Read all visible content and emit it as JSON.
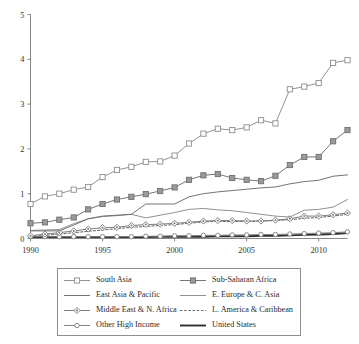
{
  "chart_data": {
    "type": "line",
    "title": "",
    "subtitle": "",
    "xlabel": "",
    "ylabel": "",
    "xlim": [
      1990,
      2012
    ],
    "ylim": [
      0,
      5
    ],
    "x_ticks": [
      1990,
      1995,
      2000,
      2005,
      2010
    ],
    "y_ticks": [
      0,
      1,
      2,
      3,
      4,
      5
    ],
    "grid": false,
    "legend_position": "below-center",
    "x": [
      1990,
      1991,
      1992,
      1993,
      1994,
      1995,
      1996,
      1997,
      1998,
      1999,
      2000,
      2001,
      2002,
      2003,
      2004,
      2005,
      2006,
      2007,
      2008,
      2009,
      2010,
      2011,
      2012
    ],
    "series": [
      {
        "name": "South Asia",
        "marker": "open-square",
        "line_style": "solid",
        "color": "#8d8d8d",
        "values": [
          0.77,
          0.94,
          1.0,
          1.09,
          1.15,
          1.37,
          1.53,
          1.6,
          1.71,
          1.72,
          1.85,
          2.12,
          2.34,
          2.45,
          2.42,
          2.48,
          2.64,
          2.57,
          3.33,
          3.39,
          3.47,
          3.92,
          3.98
        ]
      },
      {
        "name": "Sub-Saharan Africa",
        "marker": "filled-square",
        "line_style": "solid",
        "color": "#6f6f6f",
        "values": [
          0.34,
          0.36,
          0.42,
          0.47,
          0.65,
          0.77,
          0.87,
          0.93,
          0.99,
          1.06,
          1.14,
          1.31,
          1.41,
          1.44,
          1.35,
          1.31,
          1.28,
          1.4,
          1.64,
          1.82,
          1.82,
          2.17,
          2.42
        ]
      },
      {
        "name": "East Asia & Pacific",
        "marker": "none",
        "line_style": "solid",
        "color": "#6b6b6b",
        "values": [
          0.17,
          0.17,
          0.17,
          0.3,
          0.44,
          0.5,
          0.52,
          0.54,
          0.77,
          0.77,
          0.77,
          0.93,
          1.0,
          1.04,
          1.07,
          1.1,
          1.13,
          1.15,
          1.22,
          1.27,
          1.3,
          1.39,
          1.42
        ]
      },
      {
        "name": "E. Europe & C. Asia",
        "marker": "none",
        "line_style": "solid",
        "color": "#8a8a8a",
        "values": [
          0.18,
          0.19,
          0.2,
          0.33,
          0.44,
          0.49,
          0.51,
          0.54,
          0.46,
          0.52,
          0.58,
          0.65,
          0.67,
          0.64,
          0.62,
          0.58,
          0.54,
          0.5,
          0.48,
          0.63,
          0.65,
          0.7,
          0.87
        ]
      },
      {
        "name": "Middle East & N. Africa",
        "marker": "diamond",
        "line_style": "solid",
        "color": "#777777",
        "values": [
          0.06,
          0.1,
          0.13,
          0.17,
          0.21,
          0.24,
          0.25,
          0.29,
          0.31,
          0.32,
          0.34,
          0.36,
          0.39,
          0.4,
          0.4,
          0.39,
          0.39,
          0.41,
          0.44,
          0.5,
          0.5,
          0.53,
          0.57
        ]
      },
      {
        "name": "L. America & Caribbean",
        "marker": "none",
        "line_style": "dashed",
        "color": "#5f5f5f",
        "values": [
          0.04,
          0.07,
          0.1,
          0.13,
          0.16,
          0.19,
          0.22,
          0.25,
          0.27,
          0.29,
          0.31,
          0.34,
          0.37,
          0.38,
          0.38,
          0.38,
          0.39,
          0.4,
          0.42,
          0.45,
          0.47,
          0.5,
          0.54
        ]
      },
      {
        "name": "Other High Income",
        "marker": "open-circle",
        "line_style": "solid",
        "color": "#7d7d7d",
        "values": [
          0.04,
          0.04,
          0.04,
          0.04,
          0.04,
          0.04,
          0.04,
          0.04,
          0.05,
          0.05,
          0.06,
          0.06,
          0.07,
          0.07,
          0.08,
          0.08,
          0.09,
          0.09,
          0.1,
          0.11,
          0.12,
          0.13,
          0.15
        ]
      },
      {
        "name": "United States",
        "marker": "none",
        "line_style": "solid-thick",
        "color": "#2e2e2e",
        "values": [
          0.03,
          0.03,
          0.03,
          0.03,
          0.03,
          0.03,
          0.03,
          0.03,
          0.03,
          0.04,
          0.04,
          0.04,
          0.04,
          0.05,
          0.05,
          0.05,
          0.06,
          0.06,
          0.07,
          0.08,
          0.09,
          0.1,
          0.12
        ]
      }
    ]
  },
  "legend": {
    "entries": [
      {
        "label": "South Asia",
        "series_index": 0
      },
      {
        "label": "Sub-Saharan Africa",
        "series_index": 1
      },
      {
        "label": "East Asia & Pacific",
        "series_index": 2
      },
      {
        "label": "E. Europe & C. Asia",
        "series_index": 3
      },
      {
        "label": "Middle East & N. Africa",
        "series_index": 4
      },
      {
        "label": "L. America & Caribbean",
        "series_index": 5
      },
      {
        "label": "Other High Income",
        "series_index": 6
      },
      {
        "label": "United States",
        "series_index": 7
      }
    ],
    "order": [
      0,
      1,
      2,
      3,
      4,
      5,
      6,
      7
    ]
  },
  "axes": {
    "x_tick_labels": [
      "1990",
      "1995",
      "2000",
      "2005",
      "2010"
    ],
    "y_tick_labels": [
      "0",
      "1",
      "2",
      "3",
      "4",
      "5"
    ]
  }
}
